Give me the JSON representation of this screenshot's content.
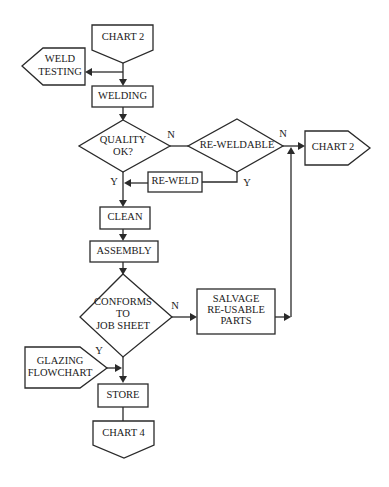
{
  "diagram": {
    "type": "flowchart",
    "nodes": {
      "chart2_top": {
        "label": "CHART 2",
        "shape": "off-page-connector-down"
      },
      "weld_testing": {
        "label1": "WELD",
        "label2": "TESTING",
        "shape": "off-page-connector-left"
      },
      "welding": {
        "label": "WELDING",
        "shape": "process"
      },
      "quality_ok": {
        "label1": "QUALITY",
        "label2": "OK?",
        "shape": "decision"
      },
      "reweldable": {
        "label": "RE-WELDABLE",
        "shape": "decision"
      },
      "chart2_right": {
        "label": "CHART 2",
        "shape": "off-page-connector-right"
      },
      "reweld": {
        "label": "RE-WELD",
        "shape": "process"
      },
      "clean": {
        "label": "CLEAN",
        "shape": "process"
      },
      "assembly": {
        "label": "ASSEMBLY",
        "shape": "process"
      },
      "conforms": {
        "label1": "CONFORMS",
        "label2": "TO",
        "label3": "JOB SHEET",
        "shape": "decision"
      },
      "salvage": {
        "label1": "SALVAGE",
        "label2": "RE-USABLE",
        "label3": "PARTS",
        "shape": "process"
      },
      "glazing": {
        "label1": "GLAZING",
        "label2": "FLOWCHART",
        "shape": "off-page-connector-right"
      },
      "store": {
        "label": "STORE",
        "shape": "process"
      },
      "chart4": {
        "label": "CHART 4",
        "shape": "off-page-connector-down"
      }
    },
    "edge_labels": {
      "quality_no": "N",
      "quality_yes": "Y",
      "reweldable_no": "N",
      "reweldable_yes": "Y",
      "conforms_no": "N",
      "conforms_yes": "Y"
    },
    "edges": [
      {
        "from": "CHART 2",
        "to": "WELDING"
      },
      {
        "from": "CHART 2",
        "to": "WELD TESTING"
      },
      {
        "from": "WELDING",
        "to": "QUALITY OK?"
      },
      {
        "from": "QUALITY OK?",
        "to": "RE-WELDABLE",
        "label": "N"
      },
      {
        "from": "QUALITY OK?",
        "to": "CLEAN",
        "label": "Y"
      },
      {
        "from": "RE-WELDABLE",
        "to": "CHART 2",
        "label": "N"
      },
      {
        "from": "RE-WELDABLE",
        "to": "RE-WELD",
        "label": "Y"
      },
      {
        "from": "RE-WELD",
        "to": "CLEAN"
      },
      {
        "from": "CLEAN",
        "to": "ASSEMBLY"
      },
      {
        "from": "ASSEMBLY",
        "to": "CONFORMS TO JOB SHEET"
      },
      {
        "from": "CONFORMS TO JOB SHEET",
        "to": "SALVAGE RE-USABLE PARTS",
        "label": "N"
      },
      {
        "from": "SALVAGE RE-USABLE PARTS",
        "to": "CHART 2"
      },
      {
        "from": "CONFORMS TO JOB SHEET",
        "to": "STORE",
        "label": "Y"
      },
      {
        "from": "GLAZING FLOWCHART",
        "to": "STORE"
      },
      {
        "from": "STORE",
        "to": "CHART 4"
      }
    ],
    "colors": {
      "stroke": "#2a2a2a",
      "background": "#ffffff"
    }
  }
}
